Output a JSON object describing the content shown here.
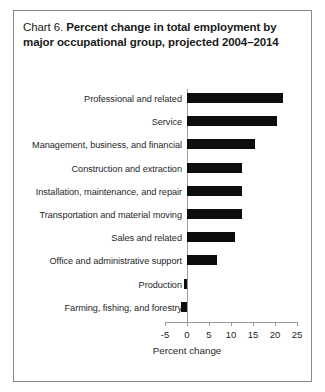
{
  "figure": {
    "title_prefix": "Chart 6.",
    "title_line1": "Percent change in total employment by",
    "title_line2": "major occupational group, projected 2004–2014",
    "border_color": "#8a8a8a",
    "background": "#ffffff",
    "bar_color": "#0d0d0d",
    "axis_color": "#9a9a9a"
  },
  "chart_data": {
    "type": "bar",
    "orientation": "horizontal",
    "title": "Chart 6.  Percent change in total employment by major occupational group, projected 2004–2014",
    "xlabel": "Percent change",
    "ylabel": "",
    "xlim": [
      -5,
      25
    ],
    "xticks": [
      -5,
      0,
      5,
      10,
      15,
      20,
      25
    ],
    "xticklabels": [
      "-5",
      "0",
      "5",
      "10",
      "15",
      "20",
      "25"
    ],
    "grid": false,
    "legend": false,
    "categories": [
      "Professional and related",
      "Service",
      "Management, business, and financial",
      "Construction and extraction",
      "Installation, maintenance, and repair",
      "Transportation and material moving",
      "Sales and related",
      "Office and administrative support",
      "Production",
      "Farming, fishing, and forestry"
    ],
    "values": [
      21.8,
      20.4,
      15.4,
      12.6,
      12.5,
      12.4,
      10.9,
      6.8,
      -0.7,
      -1.4
    ]
  }
}
